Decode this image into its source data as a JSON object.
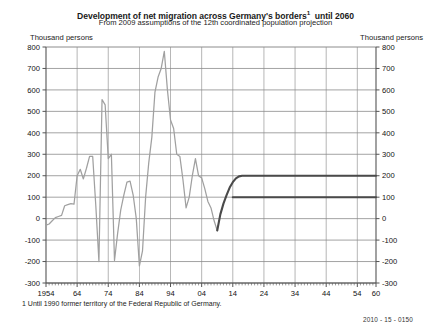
{
  "header": {
    "title_main": "Development of net migration across Germany's borders",
    "title_footnote_marker": "1",
    "title_tail": "until 2060",
    "subtitle": "From 2009 assumptions of the 12th coordinated population projection"
  },
  "axis_units": {
    "left_label": "Thousand persons",
    "right_label": "Thousand persons"
  },
  "footnote": {
    "text": "1  Until 1990 former territory of the Federal Republic of Germany."
  },
  "source": {
    "code": "2010 - 15 - 0150"
  },
  "colors": {
    "historical_line": "#a0a0a0",
    "projection_line": "#4a4a4a",
    "gridline": "#8c8c8c",
    "axis": "#555555",
    "background": "#ffffff",
    "text": "#111111"
  },
  "chart_data": {
    "type": "line",
    "subtitle": "From 2009 assumptions of the 12th coordinated population projection",
    "xlabel": "",
    "ylabel": "Thousand persons",
    "xlim": [
      1954,
      2060
    ],
    "ylim": [
      -300,
      800
    ],
    "ytick_values": [
      800,
      700,
      600,
      500,
      400,
      300,
      200,
      100,
      0,
      -100,
      -200,
      -300
    ],
    "ytick_labels": [
      "800",
      "700",
      "600",
      "500",
      "400",
      "300",
      "200",
      "100",
      "0",
      "-100",
      "-200",
      "-300"
    ],
    "xtick_values": [
      1954,
      1964,
      1974,
      1984,
      1994,
      2004,
      2014,
      2024,
      2034,
      2044,
      2054,
      2060
    ],
    "xtick_labels": [
      "1954",
      "64",
      "74",
      "84",
      "94",
      "04",
      "14",
      "24",
      "34",
      "44",
      "54",
      "60"
    ],
    "grid": true,
    "legend": "none",
    "series": [
      {
        "name": "Net migration (observed)",
        "style": "historical",
        "color": "#a0a0a0",
        "x": [
          1954,
          1955,
          1956,
          1957,
          1958,
          1959,
          1960,
          1961,
          1962,
          1963,
          1964,
          1965,
          1966,
          1967,
          1968,
          1969,
          1970,
          1971,
          1972,
          1973,
          1974,
          1975,
          1976,
          1977,
          1978,
          1979,
          1980,
          1981,
          1982,
          1983,
          1984,
          1985,
          1986,
          1987,
          1988,
          1989,
          1990,
          1991,
          1992,
          1993,
          1994,
          1995,
          1996,
          1997,
          1998,
          1999,
          2000,
          2001,
          2002,
          2003,
          2004,
          2005,
          2006,
          2007,
          2008,
          2009
        ],
        "y": [
          -30,
          -25,
          -10,
          5,
          10,
          15,
          60,
          65,
          70,
          68,
          200,
          230,
          185,
          235,
          290,
          290,
          60,
          -200,
          555,
          530,
          280,
          300,
          -195,
          -70,
          40,
          110,
          170,
          175,
          110,
          0,
          -220,
          -150,
          100,
          260,
          380,
          590,
          660,
          700,
          780,
          600,
          460,
          420,
          300,
          290,
          180,
          50,
          100,
          200,
          280,
          200,
          190,
          140,
          80,
          50,
          -10,
          -55
        ]
      },
      {
        "name": "Upper variant of projection (200 thousand)",
        "style": "projection",
        "color": "#4a4a4a",
        "x": [
          2009,
          2010,
          2011,
          2012,
          2013,
          2014,
          2015,
          2016,
          2017,
          2018,
          2019,
          2020,
          2025,
          2030,
          2035,
          2040,
          2045,
          2050,
          2055,
          2060
        ],
        "y": [
          -55,
          20,
          70,
          110,
          145,
          170,
          188,
          197,
          200,
          200,
          200,
          200,
          200,
          200,
          200,
          200,
          200,
          200,
          200,
          200
        ]
      },
      {
        "name": "Lower variant of projection (100 thousand)",
        "style": "projection",
        "color": "#4a4a4a",
        "x": [
          2014,
          2020,
          2030,
          2040,
          2050,
          2060
        ],
        "y": [
          100,
          100,
          100,
          100,
          100,
          100
        ]
      }
    ]
  }
}
